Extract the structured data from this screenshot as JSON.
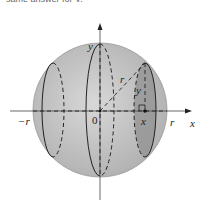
{
  "caption": "same answer for V.",
  "labels": {
    "y_axis": "y",
    "x_axis": "x",
    "neg_r": "−r",
    "origin": "0",
    "radius": "r",
    "right_r": "r",
    "slice_x": "x",
    "slice_y": "y"
  },
  "colors": {
    "sphere_fill": "#c4c4c4",
    "slice_fill": "#8e8e8e",
    "line": "#222222"
  }
}
